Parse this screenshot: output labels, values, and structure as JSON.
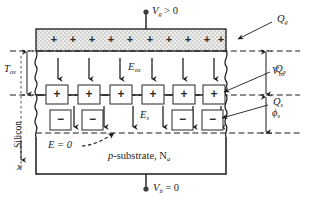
{
  "figure": {
    "name": "mos-capacitor-charge-field-diagram",
    "type": "device cross-section diagram"
  },
  "labels": {
    "gate_bias": "V",
    "gate_bias_sub": "g",
    "gate_bias_rel": " > 0",
    "body_bias": "V",
    "body_bias_sub": "b",
    "body_bias_rel": " = 0",
    "gate_charge": "Q",
    "gate_charge_sub": "g",
    "oxide_charge": "Q",
    "oxide_charge_sub": "o",
    "surface_charge": "Q",
    "surface_charge_sub": "s",
    "oxide_thickness": "T",
    "oxide_thickness_sub": "ox",
    "oxide_field": "E",
    "oxide_field_sub": "ox",
    "silicon_field": "E",
    "silicon_field_sub": "s",
    "oxide_voltage": "V",
    "oxide_voltage_sub": "ox",
    "surface_potential": "ϕ",
    "surface_potential_sub": "s",
    "zero_field": "E = 0",
    "silicon_side": "Silicon",
    "depth_axis": "x",
    "substrate": "p",
    "substrate_rest": "-substrate, N",
    "substrate_sub": "a"
  },
  "charges": {
    "gate_plus_count": 10,
    "gate_plus_symbol": "+",
    "interface_plus_count": 6,
    "interface_plus_symbol": "+",
    "depletion_minus_count": 4,
    "depletion_minus_symbol": "−"
  },
  "fields": {
    "oxide_arrow_count": 6,
    "silicon_arrow_count": 6,
    "direction": "down"
  },
  "colors": {
    "line": "#1b1b1b",
    "text": "#1b1b1b",
    "gate_fill": "#e8e8e6",
    "stipple": "#6a6a6a",
    "background": "#ffffff",
    "box_stroke": "#3a3a3a"
  }
}
